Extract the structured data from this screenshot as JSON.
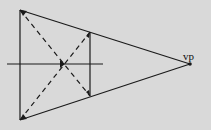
{
  "diagram": {
    "background": "#d9d9d9",
    "stroke": "#1a1a1a",
    "vanishing_point": {
      "label": "vp",
      "x": 190,
      "y": 64
    },
    "front_edge": {
      "top": {
        "x": 20,
        "y": 10
      },
      "bottom": {
        "x": 20,
        "y": 120
      }
    },
    "back_edge": {
      "top": {
        "x": 90,
        "y": 32
      },
      "bottom": {
        "x": 90,
        "y": 96
      }
    },
    "horizon": {
      "x1": 7,
      "x2": 103,
      "y": 64
    }
  }
}
